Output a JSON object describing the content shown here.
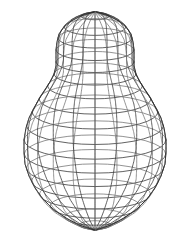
{
  "figure": {
    "title": "",
    "caption": "",
    "kind": "wireframe-surface-of-revolution",
    "background_color": "#ffffff",
    "line_color": "#3a3a3a",
    "line_color_faint": "#777777",
    "silhouette_color": "#2b2b2b",
    "line_width": 0.8,
    "silhouette_width": 0.9,
    "canvas": {
      "width": 183,
      "height": 240
    }
  },
  "chart_data": {
    "type": "line",
    "title": "",
    "xlabel": "",
    "ylabel": "",
    "grid": false,
    "legend": "none",
    "axis_of_revolution_x": 95,
    "top_apex_y": 12,
    "bottom_apex_y": 230,
    "view_tilt_ratio": 0.27,
    "meridian_count": 20,
    "latitude_count": 17,
    "profile_note": "radius (half-width in px) sampled along the vertical axis from top apex to bottom apex",
    "profile": [
      {
        "y": 12,
        "r": 1
      },
      {
        "y": 16,
        "r": 14
      },
      {
        "y": 21,
        "r": 24
      },
      {
        "y": 27,
        "r": 31
      },
      {
        "y": 34,
        "r": 36
      },
      {
        "y": 42,
        "r": 38
      },
      {
        "y": 50,
        "r": 39
      },
      {
        "y": 58,
        "r": 39
      },
      {
        "y": 66,
        "r": 39
      },
      {
        "y": 74,
        "r": 41
      },
      {
        "y": 82,
        "r": 45
      },
      {
        "y": 90,
        "r": 50
      },
      {
        "y": 99,
        "r": 56
      },
      {
        "y": 108,
        "r": 61
      },
      {
        "y": 118,
        "r": 66
      },
      {
        "y": 128,
        "r": 69
      },
      {
        "y": 140,
        "r": 71
      },
      {
        "y": 152,
        "r": 71
      },
      {
        "y": 164,
        "r": 70
      },
      {
        "y": 176,
        "r": 66
      },
      {
        "y": 188,
        "r": 60
      },
      {
        "y": 199,
        "r": 52
      },
      {
        "y": 209,
        "r": 42
      },
      {
        "y": 218,
        "r": 29
      },
      {
        "y": 225,
        "r": 16
      },
      {
        "y": 230,
        "r": 1
      }
    ],
    "latitude_rings_y": [
      16,
      27,
      38,
      50,
      62,
      74,
      86,
      99,
      112,
      126,
      140,
      154,
      168,
      181,
      194,
      206,
      217,
      225
    ]
  }
}
